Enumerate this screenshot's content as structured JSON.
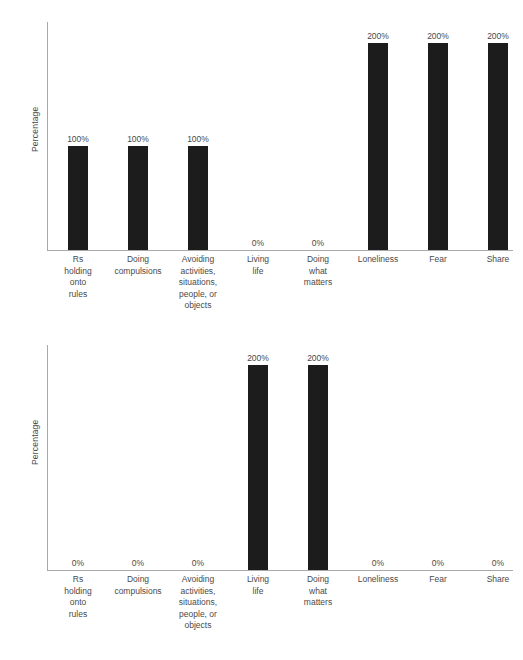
{
  "figure": {
    "background_color": "#ffffff",
    "bar_color": "#1c1c1c",
    "axis_color": "#a8a8a8",
    "text_color": "#4a4a4a"
  },
  "charts": [
    {
      "id": "top",
      "ylabel": "Percentage",
      "categories": [
        "Rs\nholding\nonto\nrules",
        "Doing\ncompulsions",
        "Avoiding\nactivities,\nsituations,\npeople, or\nobjects",
        "Living\nlife",
        "Doing\nwhat\nmatters",
        "Loneliness",
        "Fear",
        "Share"
      ],
      "values": [
        100,
        100,
        100,
        0,
        0,
        200,
        200,
        200
      ],
      "labels": [
        "100%",
        "100%",
        "100%",
        "0%",
        "0%",
        "200%",
        "200%",
        "200%"
      ]
    },
    {
      "id": "bottom",
      "ylabel": "Percentage",
      "categories": [
        "Rs\nholding\nonto\nrules",
        "Doing\ncompulsions",
        "Avoiding\nactivities,\nsituations,\npeople, or\nobjects",
        "Living\nlife",
        "Doing\nwhat\nmatters",
        "Loneliness",
        "Fear",
        "Share"
      ],
      "values": [
        0,
        0,
        0,
        200,
        200,
        0,
        0,
        0
      ],
      "labels": [
        "0%",
        "0%",
        "0%",
        "200%",
        "200%",
        "0%",
        "0%",
        "0%"
      ]
    }
  ],
  "chart_data": [
    {
      "type": "bar",
      "title": "",
      "xlabel": "",
      "ylabel": "Percentage",
      "ylim": [
        0,
        220
      ],
      "grid": false,
      "legend": "none",
      "axis_tick_labels_y": [],
      "categories": [
        "Rs holding onto rules",
        "Doing compulsions",
        "Avoiding activities, situations, people, or objects",
        "Living life",
        "Doing what matters",
        "Loneliness",
        "Fear",
        "Share"
      ],
      "values": [
        100,
        100,
        100,
        0,
        0,
        200,
        200,
        200
      ],
      "data_labels": [
        "100%",
        "100%",
        "100%",
        "0%",
        "0%",
        "200%",
        "200%",
        "200%"
      ]
    },
    {
      "type": "bar",
      "title": "",
      "xlabel": "",
      "ylabel": "Percentage",
      "ylim": [
        0,
        220
      ],
      "grid": false,
      "legend": "none",
      "axis_tick_labels_y": [],
      "categories": [
        "Rs holding onto rules",
        "Doing compulsions",
        "Avoiding activities, situations, people, or objects",
        "Living life",
        "Doing what matters",
        "Loneliness",
        "Fear",
        "Share"
      ],
      "values": [
        0,
        0,
        0,
        200,
        200,
        0,
        0,
        0
      ],
      "data_labels": [
        "0%",
        "0%",
        "0%",
        "200%",
        "200%",
        "0%",
        "0%",
        "0%"
      ]
    }
  ]
}
